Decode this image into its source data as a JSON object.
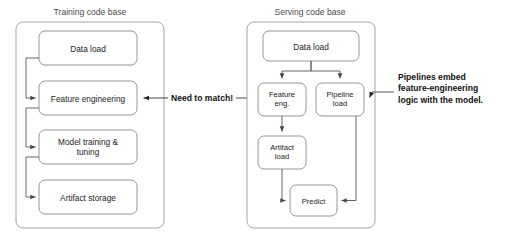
{
  "diagram": {
    "title_left": "Training code base",
    "title_right": "Serving code base",
    "middle_label": "Need to match!",
    "callout": {
      "line1": "Pipelines embed",
      "line2": "feature-engineering",
      "line3": "logic with the model."
    },
    "training_steps": [
      {
        "id": "train-data-load",
        "label": "Data load"
      },
      {
        "id": "train-feature-engineering",
        "label": "Feature engineering"
      },
      {
        "id": "train-model-training",
        "label": "Model training &",
        "label2": "tuning"
      },
      {
        "id": "train-artifact-storage",
        "label": "Artifact storage"
      }
    ],
    "serving_steps": [
      {
        "id": "serve-data-load",
        "label": "Data load"
      },
      {
        "id": "serve-feature-eng",
        "label": "Feature",
        "label2": "eng."
      },
      {
        "id": "serve-pipeline-load",
        "label": "Pipeline",
        "label2": "load"
      },
      {
        "id": "serve-artifact-load",
        "label": "Artifact",
        "label2": "load"
      },
      {
        "id": "serve-predict",
        "label": "Predict"
      }
    ],
    "colors": {
      "background": "#ffffff",
      "box_stroke": "#8a8a8a",
      "container_stroke": "#9a9a9a",
      "connector": "#555555",
      "text": "#222222",
      "title_text": "#4a4a4a"
    }
  }
}
